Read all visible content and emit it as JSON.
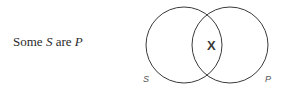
{
  "proposition": {
    "quantifier": "Some",
    "subject": "S",
    "copula": "are",
    "predicate": "P"
  },
  "diagram": {
    "type": "venn",
    "circles": [
      {
        "label": "S",
        "cx": 184,
        "cy": 45,
        "r": 38
      },
      {
        "label": "P",
        "cx": 230,
        "cy": 45,
        "r": 38
      }
    ],
    "mark": {
      "symbol": "X",
      "region": "S∩P"
    },
    "stroke_color": "#3a3a3a"
  }
}
